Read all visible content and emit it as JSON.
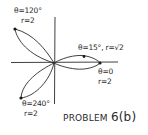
{
  "diagram": {
    "title": "PROBLEM",
    "title_number": "6(b)",
    "curve": "three-leaf rose (polar)",
    "stroke_color": "#2a2a2a",
    "background": "#ffffff",
    "points": [
      {
        "theta_label": "θ=120°",
        "r_label": "r=2"
      },
      {
        "label": "θ=15°, r=√2"
      },
      {
        "theta_label": "θ=0",
        "r_label": "r=2"
      },
      {
        "theta_label": "θ=240°",
        "r_label": "r=2"
      }
    ]
  }
}
